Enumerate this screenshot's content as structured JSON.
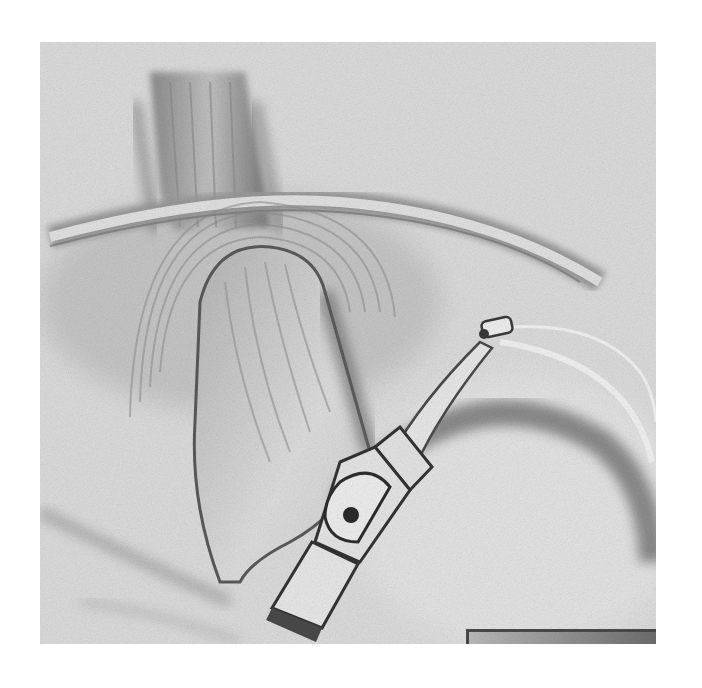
{
  "figure": {
    "type": "grayscale anatomical illustration",
    "colors": {
      "background": "#ffffff",
      "canvas": "#d9d9d9",
      "shadow": "#6e6e6e",
      "highlight": "#f2f2f2",
      "device": "#e6e6e6",
      "device_outline": "#3a3a3a",
      "scale_bar": "#8a8a8a"
    },
    "elements": [
      "vertical-muscle-band",
      "arched-membrane",
      "looped-tubular-structure",
      "large-curved-fold",
      "clip-device",
      "device-pivot-hole",
      "device-probe-arm",
      "probe-tip",
      "lead-wire",
      "scale-bar"
    ]
  }
}
